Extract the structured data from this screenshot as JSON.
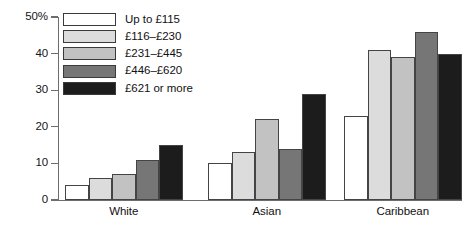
{
  "chart_data": {
    "type": "bar",
    "title": "",
    "xlabel": "",
    "ylabel": "",
    "ylim": [
      0,
      50
    ],
    "yticks": [
      0,
      10,
      20,
      30,
      40,
      50
    ],
    "ytick_labels": [
      "0",
      "10",
      "20",
      "30",
      "40",
      "50%"
    ],
    "grid": false,
    "legend_position": "top-left",
    "categories": [
      "White",
      "Asian",
      "Caribbean"
    ],
    "series": [
      {
        "name": "Up to £115",
        "values": [
          4,
          10,
          23
        ],
        "color": "#ffffff"
      },
      {
        "name": "£116–£230",
        "values": [
          6,
          13,
          41
        ],
        "color": "#dcdcdc"
      },
      {
        "name": "£231–£445",
        "values": [
          7,
          22,
          39
        ],
        "color": "#c2c2c2"
      },
      {
        "name": "£446–£620",
        "values": [
          11,
          14,
          46
        ],
        "color": "#767676"
      },
      {
        "name": "£621 or more",
        "values": [
          15,
          29,
          40
        ],
        "color": "#1c1c1c"
      }
    ]
  },
  "axis": {
    "stroke": "#6d6d6d"
  },
  "legend": {
    "items": [
      {
        "label": "Up to £115"
      },
      {
        "label": "£116–£230"
      },
      {
        "label": "£231–£445"
      },
      {
        "label": "£446–£620"
      },
      {
        "label": "£621 or more"
      }
    ]
  }
}
